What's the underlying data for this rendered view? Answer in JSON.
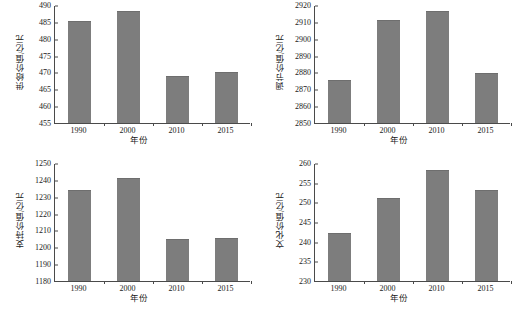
{
  "figure": {
    "background": "#ffffff",
    "bar_color": "#7d7d7d",
    "axis_color": "#4a4a4a",
    "panel_count": 4
  },
  "chart_data": [
    {
      "type": "bar",
      "panel": "top-left",
      "title": "",
      "xlabel": "年份",
      "ylabel": "供给价值/亿元",
      "categories": [
        "1990",
        "2000",
        "2010",
        "2015"
      ],
      "values": [
        485.3,
        488.2,
        468.9,
        470.2
      ],
      "ylim": [
        455,
        490
      ],
      "yticks": [
        455,
        460,
        465,
        470,
        475,
        480,
        485,
        490
      ],
      "grid": false,
      "legend": "none"
    },
    {
      "type": "bar",
      "panel": "top-right",
      "title": "",
      "xlabel": "年份",
      "ylabel": "调节价值/亿元",
      "categories": [
        "1990",
        "2000",
        "2010",
        "2015"
      ],
      "values": [
        2875.5,
        2911.0,
        2916.3,
        2879.5
      ],
      "ylim": [
        2850,
        2920
      ],
      "yticks": [
        2850,
        2860,
        2870,
        2880,
        2890,
        2900,
        2910,
        2920
      ],
      "grid": false,
      "legend": "none"
    },
    {
      "type": "bar",
      "panel": "bottom-left",
      "title": "",
      "xlabel": "年份",
      "ylabel": "支持价值/亿元",
      "categories": [
        "1990",
        "2000",
        "2010",
        "2015"
      ],
      "values": [
        1234.0,
        1241.0,
        1204.8,
        1205.5
      ],
      "ylim": [
        1180,
        1250
      ],
      "yticks": [
        1180,
        1190,
        1200,
        1210,
        1220,
        1230,
        1240,
        1250
      ],
      "grid": false,
      "legend": "none"
    },
    {
      "type": "bar",
      "panel": "bottom-right",
      "title": "",
      "xlabel": "年份",
      "ylabel": "文化价值/亿元",
      "categories": [
        "1990",
        "2000",
        "2010",
        "2015"
      ],
      "values": [
        242.3,
        251.1,
        258.1,
        253.2
      ],
      "ylim": [
        230,
        260
      ],
      "yticks": [
        230,
        235,
        240,
        245,
        250,
        255,
        260
      ],
      "grid": false,
      "legend": "none"
    }
  ]
}
